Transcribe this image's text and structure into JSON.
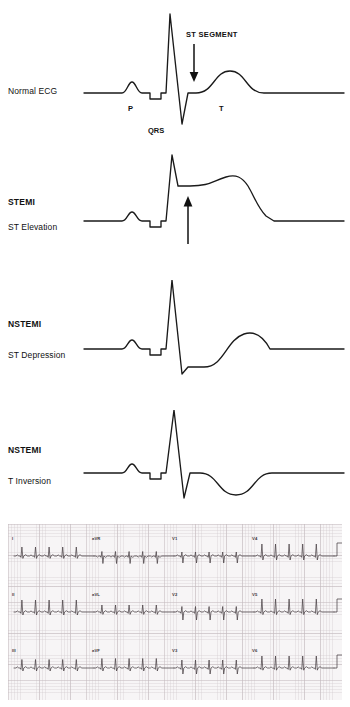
{
  "figure": {
    "line_color": "#1a1a1a",
    "background": "#ffffff"
  },
  "panels": [
    {
      "id": "normal",
      "label_main": "",
      "label_sub": "",
      "label_single": "Normal ECG",
      "annotations": {
        "st_segment": "ST SEGMENT",
        "p_wave": "P",
        "qrs_complex": "QRS",
        "t_wave": "T"
      },
      "arrow": {
        "direction": "down",
        "meaning": "points to the isoelectric ST segment"
      }
    },
    {
      "id": "stemi",
      "label_main": "STEMI",
      "label_sub": "ST Elevation",
      "label_single": "",
      "annotations": {},
      "arrow": {
        "direction": "up",
        "meaning": "ST segment elevated above baseline"
      }
    },
    {
      "id": "nstemi-depression",
      "label_main": "NSTEMI",
      "label_sub": "ST Depression",
      "label_single": "",
      "annotations": {},
      "arrow": {
        "direction": "down",
        "meaning": "ST segment depressed below baseline"
      }
    },
    {
      "id": "nstemi-t-inversion",
      "label_main": "NSTEMI",
      "label_sub": "T Inversion",
      "label_single": "",
      "annotations": {},
      "arrow": {
        "direction": "none",
        "meaning": "T wave inverted below baseline"
      }
    }
  ],
  "ecg_strip": {
    "paper_color": "#f7f5f6",
    "grid_color": "#c4babe",
    "trace_color": "#4a4246",
    "rows": [
      {
        "leads": [
          "I",
          "aVR",
          "V1",
          "V4"
        ]
      },
      {
        "leads": [
          "II",
          "aVL",
          "V2",
          "V5"
        ]
      },
      {
        "leads": [
          "III",
          "aVF",
          "V3",
          "V6"
        ]
      }
    ]
  },
  "chart_data": {
    "type": "line",
    "xlabel": "",
    "ylabel": "",
    "grid": false,
    "legend_position": "left",
    "series": [
      {
        "name": "Normal ECG",
        "description": "Isoelectric ST segment, upright T wave",
        "features": {
          "p_wave": "small upright deflection",
          "qrs": "tall R wave with deep S",
          "st_segment": "isoelectric (at baseline)",
          "t_wave": "upright, rounded"
        }
      },
      {
        "name": "STEMI - ST Elevation",
        "description": "ST segment raised above baseline, merging into T wave",
        "features": {
          "p_wave": "small upright deflection",
          "qrs": "tall R wave with deep S",
          "st_segment": "elevated above baseline",
          "t_wave": "merged with elevated ST (tombstone)"
        }
      },
      {
        "name": "NSTEMI - ST Depression",
        "description": "ST segment below baseline before upright T wave",
        "features": {
          "p_wave": "small upright deflection",
          "qrs": "tall R wave with deep S",
          "st_segment": "depressed below baseline",
          "t_wave": "upright, rounded"
        }
      },
      {
        "name": "NSTEMI - T Inversion",
        "description": "Isoelectric ST segment with inverted T wave",
        "features": {
          "p_wave": "small upright deflection",
          "qrs": "tall R wave with deep S",
          "st_segment": "isoelectric",
          "t_wave": "inverted (below baseline)"
        }
      }
    ]
  }
}
